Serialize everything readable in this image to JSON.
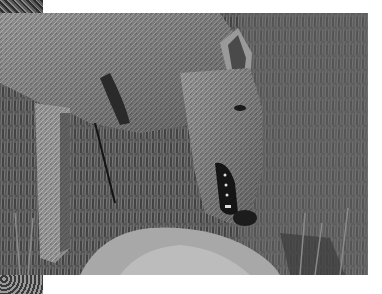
{
  "image": {
    "subject": "wolf bending over prey in grass",
    "style": "grayscale photograph",
    "colors": {
      "border": "#ffffff",
      "fur_light": "#b8b8b8",
      "fur_mid": "#8c8c8c",
      "shadow": "#1e1e1e",
      "grass": "#5a5a5a"
    }
  }
}
